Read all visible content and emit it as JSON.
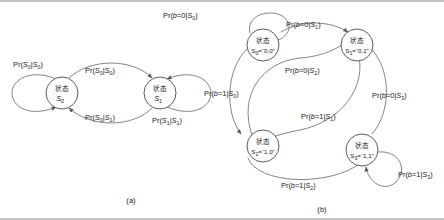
{
  "figure": {
    "background": "#ffffff",
    "line_color": "#6e6e6e",
    "text_color": "#1a1a1a",
    "panels": [
      {
        "id": "a",
        "caption": "(a)",
        "nodes": [
          {
            "cn": "状态",
            "base": "S",
            "sub": "0",
            "value": ""
          },
          {
            "cn": "状态",
            "base": "S",
            "sub": "1",
            "value": ""
          }
        ],
        "edge_labels": [
          {
            "pre": "Pr(",
            "arg": "S",
            "arg_sub": "0",
            "bar": "|",
            "cond": "S",
            "cond_sub": "0",
            "post": ")",
            "full": "Pr(S0|S0)"
          },
          {
            "pre": "Pr(",
            "arg": "S",
            "arg_sub": "1",
            "bar": "|",
            "cond": "S",
            "cond_sub": "0",
            "post": ")",
            "full": "Pr(S1|S0)"
          },
          {
            "pre": "Pr(",
            "arg": "S",
            "arg_sub": "0",
            "bar": "|",
            "cond": "S",
            "cond_sub": "1",
            "post": ")",
            "full": "Pr(S0|S1)"
          },
          {
            "pre": "Pr(",
            "arg": "S",
            "arg_sub": "1",
            "bar": "|",
            "cond": "S",
            "cond_sub": "1",
            "post": ")",
            "full": "Pr(S1|S1)"
          }
        ]
      },
      {
        "id": "b",
        "caption": "(b)",
        "nodes": [
          {
            "cn": "状态",
            "base": "S",
            "sub": "0",
            "value": "=“0,0”"
          },
          {
            "cn": "状态",
            "base": "S",
            "sub": "1",
            "value": "=“0,1”"
          },
          {
            "cn": "状态",
            "base": "S",
            "sub": "2",
            "value": "=“1,0”"
          },
          {
            "cn": "状态",
            "base": "S",
            "sub": "3",
            "value": "=“1,1”"
          }
        ],
        "edge_labels": [
          {
            "pre": "Pr(",
            "b": "b",
            "eq": "=0|",
            "cond": "S",
            "cond_sub": "0",
            "post": ")",
            "full": "Pr(b=0|S0)"
          },
          {
            "pre": "Pr(",
            "b": "b",
            "eq": "=0|",
            "cond": "S",
            "cond_sub": "1",
            "post": ")",
            "full": "Pr(b=0|S1)"
          },
          {
            "pre": "Pr(",
            "b": "b",
            "eq": "=0|",
            "cond": "S",
            "cond_sub": "2",
            "post": ")",
            "full": "Pr(b=0|S2)"
          },
          {
            "pre": "Pr(",
            "b": "b",
            "eq": "=0|",
            "cond": "S",
            "cond_sub": "3",
            "post": ")",
            "full": "Pr(b=0|S3)"
          },
          {
            "pre": "Pr(",
            "b": "b",
            "eq": "=1|",
            "cond": "S",
            "cond_sub": "0",
            "post": ")",
            "full": "Pr(b=1|S0)"
          },
          {
            "pre": "Pr(",
            "b": "b",
            "eq": "=1|",
            "cond": "S",
            "cond_sub": "1",
            "post": ")",
            "full": "Pr(b=1|S1)"
          },
          {
            "pre": "Pr(",
            "b": "b",
            "eq": "=1|",
            "cond": "S",
            "cond_sub": "2",
            "post": ")",
            "full": "Pr(b=1|S2)"
          },
          {
            "pre": "Pr(",
            "b": "b",
            "eq": "=1|",
            "cond": "S",
            "cond_sub": "3",
            "post": ")",
            "full": "Pr(b=1|S3)"
          }
        ]
      }
    ]
  },
  "labels": {
    "a_s0s0_pre": "Pr(",
    "a_s0s0_a": "S",
    "a_s0s0_asub": "0",
    "a_s0s0_bar": "|",
    "a_s0s0_c": "S",
    "a_s0s0_csub": "0",
    "a_close": ")",
    "a_s1s0_a": "S",
    "a_s1s0_asub": "1",
    "a_s1s0_c": "S",
    "a_s1s0_csub": "0",
    "a_s0s1_a": "S",
    "a_s0s1_asub": "0",
    "a_s0s1_c": "S",
    "a_s0s1_csub": "1",
    "a_s1s1_a": "S",
    "a_s1s1_asub": "1",
    "a_s1s1_c": "S",
    "a_s1s1_csub": "1",
    "pr": "Pr(",
    "close": ")",
    "bvar": "b",
    "eq0": "=0|",
    "eq1": "=1|",
    "S": "S",
    "cn_state": "状态",
    "n0_sub": "0",
    "n1_sub": "1",
    "n2_sub": "2",
    "n3_sub": "3",
    "n0_val": "=“0,0”",
    "n1_val": "=“0,1”",
    "n2_val": "=“1,0”",
    "n3_val": "=“1,1”",
    "caption_a": "(a)",
    "caption_b": "(b)"
  }
}
